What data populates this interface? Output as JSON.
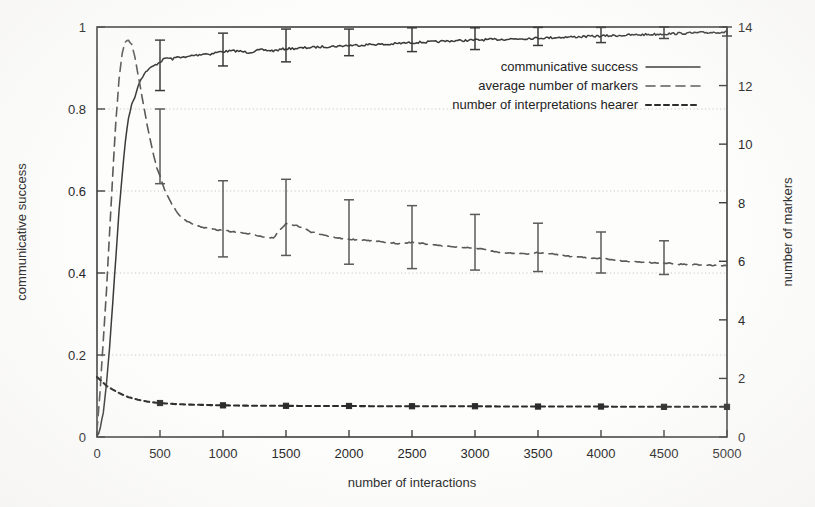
{
  "chart_data": {
    "type": "line",
    "title": "",
    "xlabel": "number of interactions",
    "ylabel": "communicative success",
    "y2label": "number of markers",
    "xlim": [
      0,
      5000
    ],
    "ylim": [
      0,
      1
    ],
    "y2lim": [
      0,
      14
    ],
    "grid": true,
    "grid_axis": "y",
    "legend_position": "upper right inside",
    "xticks": [
      0,
      500,
      1000,
      1500,
      2000,
      2500,
      3000,
      3500,
      4000,
      4500,
      5000
    ],
    "xtick_labels": [
      "0",
      "500",
      "1000",
      "1500",
      "2000",
      "2500",
      "3000",
      "3500",
      "4000",
      "4500",
      "5000"
    ],
    "yticks": [
      0,
      0.2,
      0.4,
      0.6,
      0.8,
      1
    ],
    "ytick_labels": [
      "0",
      "0.2",
      "0.4",
      "0.6",
      "0.8",
      "1"
    ],
    "y2ticks": [
      0,
      2,
      4,
      6,
      8,
      10,
      12,
      14
    ],
    "y2tick_labels": [
      "0",
      "2",
      "4",
      "6",
      "8",
      "10",
      "12",
      "14"
    ],
    "series": [
      {
        "name": "communicative success",
        "axis": "left",
        "style": "solid",
        "color": "#3a3a3a",
        "x": [
          0,
          25,
          50,
          75,
          100,
          125,
          150,
          175,
          200,
          225,
          250,
          275,
          300,
          325,
          350,
          375,
          400,
          425,
          450,
          475,
          500,
          550,
          600,
          650,
          700,
          750,
          800,
          850,
          900,
          950,
          1000,
          1100,
          1200,
          1300,
          1400,
          1500,
          1600,
          1700,
          1800,
          1900,
          2000,
          2100,
          2200,
          2300,
          2400,
          2500,
          2600,
          2700,
          2800,
          2900,
          3000,
          3200,
          3400,
          3600,
          3800,
          4000,
          4200,
          4400,
          4600,
          4800,
          5000
        ],
        "y": [
          0.0,
          0.02,
          0.06,
          0.13,
          0.22,
          0.33,
          0.44,
          0.55,
          0.64,
          0.72,
          0.78,
          0.81,
          0.83,
          0.855,
          0.875,
          0.885,
          0.895,
          0.9,
          0.905,
          0.91,
          0.915,
          0.925,
          0.922,
          0.928,
          0.925,
          0.93,
          0.932,
          0.935,
          0.934,
          0.938,
          0.94,
          0.942,
          0.938,
          0.944,
          0.942,
          0.947,
          0.948,
          0.95,
          0.952,
          0.953,
          0.955,
          0.956,
          0.958,
          0.957,
          0.96,
          0.962,
          0.963,
          0.964,
          0.966,
          0.967,
          0.968,
          0.97,
          0.972,
          0.974,
          0.976,
          0.978,
          0.98,
          0.982,
          0.984,
          0.986,
          0.988
        ],
        "errorbars": [
          {
            "x": 500,
            "y": 0.915,
            "lo": 0.845,
            "hi": 0.968
          },
          {
            "x": 1000,
            "y": 0.94,
            "hi": 0.985,
            "lo": 0.905
          },
          {
            "x": 1500,
            "y": 0.947,
            "hi": 0.995,
            "lo": 0.915
          },
          {
            "x": 2000,
            "y": 0.955,
            "hi": 0.995,
            "lo": 0.93
          },
          {
            "x": 2500,
            "y": 0.962,
            "hi": 0.998,
            "lo": 0.94
          },
          {
            "x": 3000,
            "y": 0.968,
            "hi": 0.998,
            "lo": 0.945
          },
          {
            "x": 3500,
            "y": 0.975,
            "hi": 0.999,
            "lo": 0.955
          },
          {
            "x": 4000,
            "y": 0.978,
            "hi": 0.999,
            "lo": 0.962
          },
          {
            "x": 4500,
            "y": 0.985,
            "hi": 1.0,
            "lo": 0.972
          },
          {
            "x": 5000,
            "y": 0.988,
            "hi": 1.0,
            "lo": 0.978
          }
        ]
      },
      {
        "name": "average number of markers",
        "axis": "right",
        "style": "dashed",
        "color": "#5a5a5a",
        "x": [
          0,
          25,
          50,
          75,
          100,
          125,
          150,
          175,
          200,
          225,
          250,
          275,
          300,
          325,
          350,
          375,
          400,
          425,
          450,
          475,
          500,
          550,
          600,
          650,
          700,
          750,
          800,
          900,
          1000,
          1100,
          1200,
          1300,
          1400,
          1500,
          1600,
          1700,
          1800,
          1900,
          2000,
          2200,
          2400,
          2500,
          2600,
          2800,
          3000,
          3200,
          3400,
          3500,
          3600,
          3800,
          4000,
          4200,
          4400,
          4500,
          4600,
          4800,
          5000
        ],
        "y_right": [
          0.2,
          1.6,
          3.3,
          5.0,
          7.0,
          9.0,
          10.8,
          12.2,
          13.1,
          13.5,
          13.55,
          13.4,
          13.0,
          12.4,
          11.8,
          11.2,
          10.6,
          10.1,
          9.6,
          9.2,
          8.9,
          8.3,
          7.9,
          7.6,
          7.4,
          7.3,
          7.2,
          7.1,
          7.05,
          7.0,
          6.95,
          6.85,
          6.8,
          7.3,
          7.2,
          7.0,
          6.9,
          6.8,
          6.75,
          6.7,
          6.6,
          6.65,
          6.6,
          6.5,
          6.45,
          6.3,
          6.25,
          6.3,
          6.25,
          6.15,
          6.1,
          6.0,
          5.95,
          5.95,
          5.9,
          5.88,
          5.85
        ],
        "errorbars": [
          {
            "x": 500,
            "y_right": 8.9,
            "hi": 11.2,
            "lo": 8.65
          },
          {
            "x": 1000,
            "y_right": 7.05,
            "hi": 8.75,
            "lo": 6.15
          },
          {
            "x": 1500,
            "y_right": 7.3,
            "hi": 8.8,
            "lo": 6.2
          },
          {
            "x": 2000,
            "y_right": 6.75,
            "hi": 8.1,
            "lo": 5.9
          },
          {
            "x": 2500,
            "y_right": 6.65,
            "hi": 7.9,
            "lo": 5.75
          },
          {
            "x": 3000,
            "y_right": 6.45,
            "hi": 7.6,
            "lo": 5.7
          },
          {
            "x": 3500,
            "y_right": 6.3,
            "hi": 7.3,
            "lo": 5.65
          },
          {
            "x": 4000,
            "y_right": 6.1,
            "hi": 7.0,
            "lo": 5.6
          },
          {
            "x": 4500,
            "y_right": 5.95,
            "hi": 6.7,
            "lo": 5.55
          }
        ]
      },
      {
        "name": "number of interpretations hearer",
        "axis": "right",
        "style": "dotted",
        "color": "#2b2b2b",
        "x": [
          0,
          25,
          50,
          75,
          100,
          150,
          200,
          250,
          300,
          350,
          400,
          450,
          500,
          600,
          700,
          800,
          900,
          1000,
          1200,
          1400,
          1600,
          1800,
          2000,
          2250,
          2500,
          2750,
          3000,
          3250,
          3500,
          3750,
          4000,
          4250,
          4500,
          4750,
          5000
        ],
        "y_right": [
          2.05,
          1.95,
          1.85,
          1.75,
          1.68,
          1.56,
          1.45,
          1.36,
          1.3,
          1.25,
          1.21,
          1.18,
          1.16,
          1.13,
          1.11,
          1.1,
          1.09,
          1.08,
          1.07,
          1.07,
          1.06,
          1.06,
          1.06,
          1.05,
          1.05,
          1.05,
          1.05,
          1.04,
          1.04,
          1.04,
          1.04,
          1.03,
          1.03,
          1.03,
          1.03
        ],
        "markers_at": [
          500,
          1000,
          1500,
          2000,
          2500,
          3000,
          3500,
          4000,
          4500,
          5000
        ]
      }
    ]
  },
  "legend": {
    "items": [
      {
        "label": "communicative success",
        "style": "solid"
      },
      {
        "label": "average number of markers",
        "style": "dashed"
      },
      {
        "label": "number of interpretations hearer",
        "style": "dotted"
      }
    ]
  }
}
